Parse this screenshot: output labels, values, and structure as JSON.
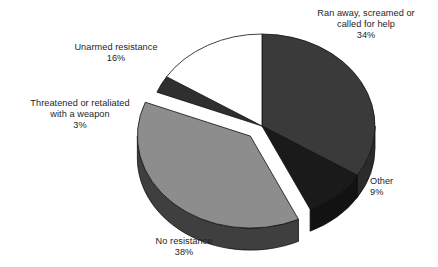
{
  "chart_data": {
    "type": "pie",
    "title": "",
    "subtitle": "",
    "xlabel": "",
    "ylabel": "",
    "legend_position": "none",
    "grid": false,
    "three_d": true,
    "exploded_slice": "No resistance",
    "units": "percent",
    "total": 100,
    "categories": [
      "Ran away, screamed or called for help",
      "Other",
      "No resistance",
      "Threatened or retaliated with a weapon",
      "Unarmed resistance"
    ],
    "values": [
      34,
      9,
      38,
      3,
      16
    ],
    "slices": [
      {
        "label": "Ran away, screamed or called for help",
        "label_line1": "Ran away, screamed or",
        "label_line2": "called for help",
        "value": 34,
        "percent_text": "34%",
        "color": "#3a3a3a",
        "side_color": "#2b2b2b"
      },
      {
        "label": "Other",
        "label_line1": "Other",
        "label_line2": "",
        "value": 9,
        "percent_text": "9%",
        "color": "#1a1a1a",
        "side_color": "#121212"
      },
      {
        "label": "No resistance",
        "label_line1": "No resistance",
        "label_line2": "",
        "value": 38,
        "percent_text": "38%",
        "color": "#8d8d8d",
        "side_color": "#3f3f3f"
      },
      {
        "label": "Threatened or retaliated with a weapon",
        "label_line1": "Threatened or retaliated",
        "label_line2": "with a weapon",
        "value": 3,
        "percent_text": "3%",
        "color": "#2f2f2f",
        "side_color": "#232323"
      },
      {
        "label": "Unarmed resistance",
        "label_line1": "Unarmed resistance",
        "label_line2": "",
        "value": 16,
        "percent_text": "16%",
        "color": "#ffffff",
        "side_color": "#c9c9c9"
      }
    ],
    "colors": {
      "background": "#ffffff",
      "outline": "#111111",
      "text": "#1e1e1e"
    }
  }
}
